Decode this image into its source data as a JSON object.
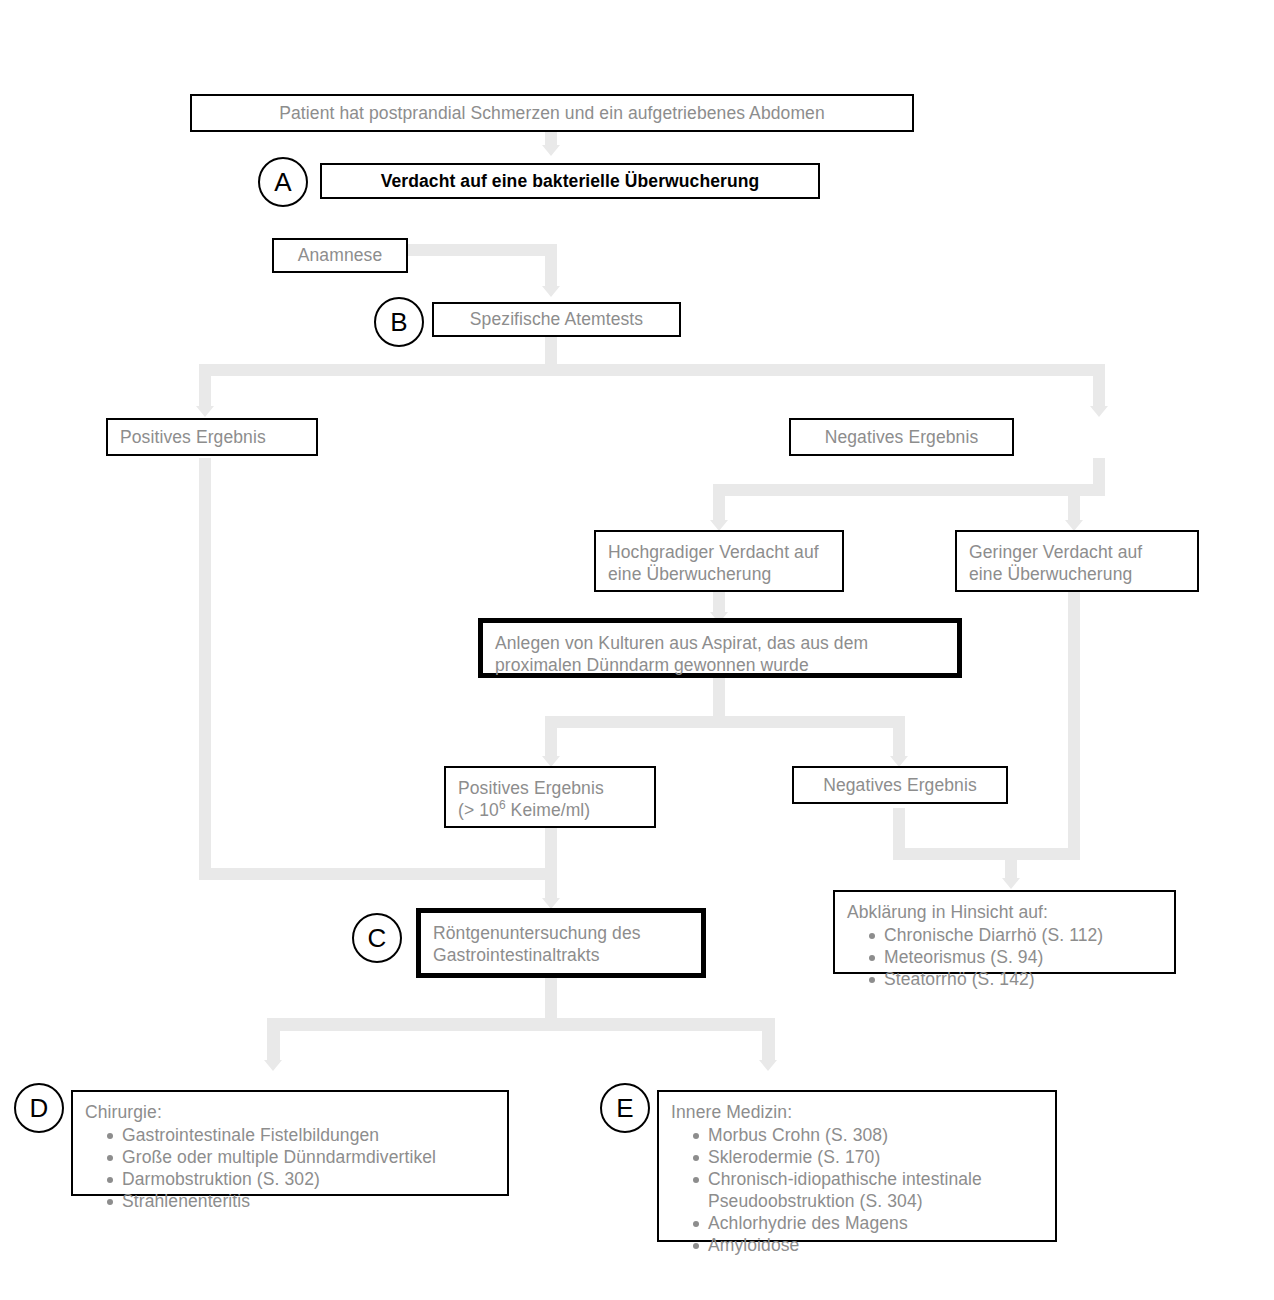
{
  "diagram": {
    "line_color": "#e9e9e9",
    "text_color": "#8d8d8d",
    "border_color": "#000000"
  },
  "nodes": {
    "patient": {
      "label": "Patient hat postprandial Schmerzen und ein aufgetriebenes Abdomen"
    },
    "verdacht": {
      "marker": "A",
      "label": "Verdacht auf eine bakterielle Überwucherung"
    },
    "anamnese": {
      "label": "Anamnese"
    },
    "atemtests": {
      "marker": "B",
      "label": "Spezifische Atemtests"
    },
    "positives_1": {
      "label": "Positives Ergebnis"
    },
    "negatives_1": {
      "label": "Negatives Ergebnis"
    },
    "hochgradig": {
      "line1": "Hochgradiger Verdacht auf",
      "line2": "eine Überwucherung"
    },
    "gering": {
      "line1": "Geringer Verdacht auf",
      "line2": "eine Überwucherung"
    },
    "kulturen": {
      "line1": "Anlegen von Kulturen aus Aspirat, das aus dem",
      "line2": "proximalen Dünndarm gewonnen wurde"
    },
    "positives_2": {
      "line1": "Positives Ergebnis",
      "line2_prefix": "(> 10",
      "line2_exp": "6",
      "line2_suffix": " Keime/ml)"
    },
    "negatives_2": {
      "label": "Negatives Ergebnis"
    },
    "abklaerung": {
      "heading": "Abklärung in Hinsicht auf:",
      "items": [
        "Chronische Diarrhö (S. 112)",
        "Meteorismus (S. 94)",
        "Steatorrhö (S. 142)"
      ]
    },
    "roentgen": {
      "marker": "C",
      "line1": "Röntgenuntersuchung des",
      "line2": "Gastrointestinaltrakts"
    },
    "chirurgie": {
      "marker": "D",
      "heading": "Chirurgie:",
      "items": [
        "Gastrointestinale Fistelbildungen",
        "Große oder multiple Dünndarmdivertikel",
        "Darmobstruktion (S. 302)",
        "Strahlenenteritis"
      ]
    },
    "innere": {
      "marker": "E",
      "heading": "Innere Medizin:",
      "items": [
        "Morbus Crohn (S. 308)",
        "Sklerodermie (S. 170)",
        "Chronisch-idiopathische intestinale\n     Pseudoobstruktion  (S. 304)",
        "Achlorhydrie des Magens",
        "Amyloidose"
      ]
    }
  }
}
